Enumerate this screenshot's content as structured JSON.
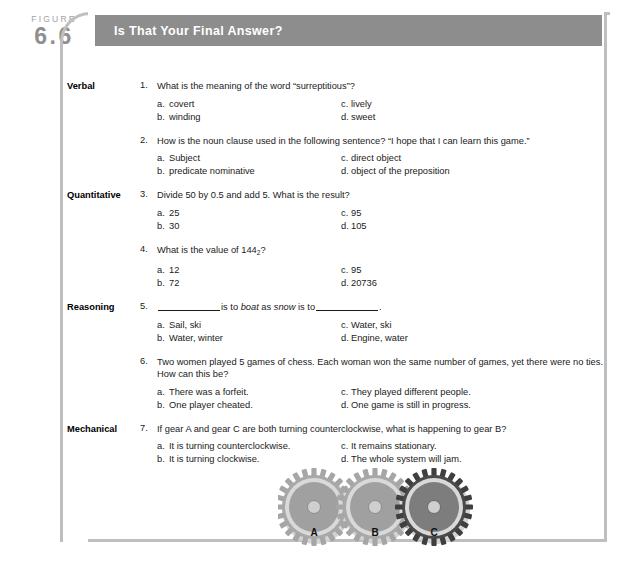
{
  "figure": {
    "word": "FIGURE",
    "number": "6.6",
    "title": "Is That Your Final Answer?"
  },
  "colors": {
    "header_bar": "#8d8d8d",
    "panel_border": "#bfbfbf",
    "figure_label": "#9a9a9a",
    "gear_light": "#b7b7b7",
    "gear_mid": "#9a9a9a",
    "gear_dark": "#6f6f6f",
    "gear_ring": "#d8d8d8",
    "text": "#1a1a1a"
  },
  "sections": [
    {
      "category": "Verbal",
      "questions": [
        {
          "num": "1.",
          "text": "What is the meaning of the word “surreptitious”?",
          "choices": {
            "a": "covert",
            "b": "winding",
            "c": "lively",
            "d": "sweet"
          }
        },
        {
          "num": "2.",
          "text": "How is the noun clause used in the following sentence? “I hope that I can learn this game.”",
          "choices": {
            "a": "Subject",
            "b": "predicate nominative",
            "c": "direct object",
            "d": "object of the preposition"
          }
        }
      ]
    },
    {
      "category": "Quantitative",
      "questions": [
        {
          "num": "3.",
          "text": "Divide 50 by 0.5 and add 5. What is the result?",
          "choices": {
            "a": "25",
            "b": "30",
            "c": "95",
            "d": "105"
          }
        },
        {
          "num": "4.",
          "text": "What is the value of 144₂?",
          "choices": {
            "a": "12",
            "b": "72",
            "c": "95",
            "d": "20736"
          }
        }
      ]
    },
    {
      "category": "Reasoning",
      "questions": [
        {
          "num": "5.",
          "text": "__________ is to boat as snow is to __________.",
          "choices": {
            "a": "Sail, ski",
            "b": "Water, winter",
            "c": "Water, ski",
            "d": "Engine, water"
          }
        },
        {
          "num": "6.",
          "text": "Two women played 5 games of chess. Each woman won the same number of games, yet there were no ties. How can this be?",
          "choices": {
            "a": "There was a forfeit.",
            "b": "One player cheated.",
            "c": "They played different people.",
            "d": "One game is still in progress."
          }
        }
      ]
    },
    {
      "category": "Mechanical",
      "questions": [
        {
          "num": "7.",
          "text": "If gear A and gear C are both turning counterclockwise, what is happening to gear B?",
          "choices": {
            "a": "It is turning counterclockwise.",
            "b": "It is turning clockwise.",
            "c": "It remains stationary.",
            "d": "The whole system will jam."
          }
        }
      ]
    }
  ],
  "gears": {
    "labels": [
      "A",
      "B",
      "C"
    ]
  }
}
